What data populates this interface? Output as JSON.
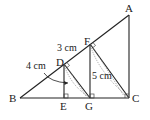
{
  "diagram": {
    "points": {
      "A": {
        "label": "A",
        "x": 129,
        "y": 15
      },
      "B": {
        "label": "B",
        "x": 20,
        "y": 98
      },
      "C": {
        "label": "C",
        "x": 129,
        "y": 98
      },
      "D": {
        "label": "D",
        "x": 64,
        "y": 64
      },
      "E": {
        "label": "E",
        "x": 64,
        "y": 98
      },
      "F": {
        "label": "F",
        "x": 90,
        "y": 44
      },
      "G": {
        "label": "G",
        "x": 90,
        "y": 98
      }
    },
    "measurements": {
      "DF": "3 cm",
      "BD": "4 cm",
      "FG": "5 cm"
    },
    "colors": {
      "line": "#222222",
      "dotted": "#777777",
      "background": "#ffffff"
    }
  }
}
